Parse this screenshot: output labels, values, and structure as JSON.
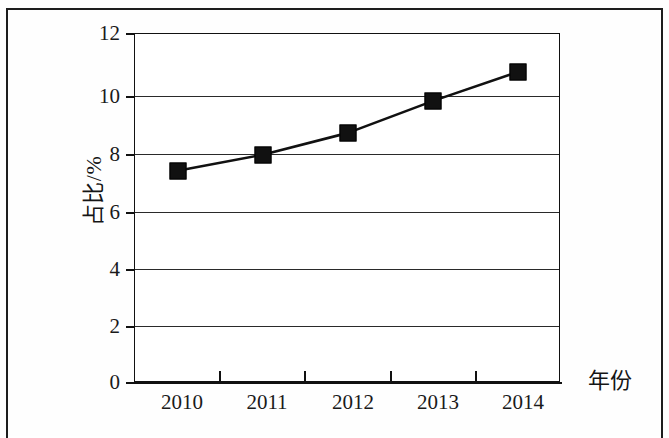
{
  "document": {
    "border_color": "#1d1d1d",
    "background": "#ffffff"
  },
  "chart_data": {
    "type": "line",
    "title": "",
    "subtitle": "",
    "xlabel": "年份",
    "ylabel": "占比/%",
    "categories": [
      "2010",
      "2011",
      "2012",
      "2013",
      "2014"
    ],
    "values": [
      7.3,
      7.85,
      8.6,
      9.7,
      10.7
    ],
    "series": [
      {
        "name": "占比/%",
        "values": [
          7.3,
          7.85,
          8.6,
          9.7,
          10.7
        ],
        "line_color": "#111111",
        "marker": "square",
        "marker_color": "#111111"
      }
    ],
    "ylim": [
      0,
      12
    ],
    "y_ticks": [
      "12",
      "10",
      "8",
      "6",
      "4",
      "2",
      "0"
    ],
    "y_tick_values": [
      12,
      10,
      8,
      6,
      4,
      2,
      0
    ],
    "x_ticks": [
      "2010",
      "2011",
      "2012",
      "2013",
      "2014"
    ],
    "grid": "horizontal",
    "legend": "none",
    "legend_position": "none",
    "annotations": []
  },
  "axes": {
    "y_title": "占比/%",
    "x_title": "年份",
    "y_tick_labels": [
      "12",
      "10",
      "8",
      "6",
      "4",
      "2",
      "0"
    ],
    "x_tick_labels": [
      "2010",
      "2011",
      "2012",
      "2013",
      "2014"
    ]
  },
  "colors": {
    "line": "#111111",
    "marker": "#111111",
    "grid": "#2a2a2a",
    "axis": "#111111",
    "text": "#1a1a1a"
  }
}
